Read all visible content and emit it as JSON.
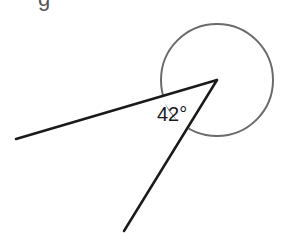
{
  "diagram": {
    "type": "angle-diagram",
    "top_partial_text": "g",
    "vertex": {
      "x": 217,
      "y": 80
    },
    "rays": [
      {
        "name": "left-ray",
        "end": {
          "x": 16,
          "y": 139
        }
      },
      {
        "name": "lower-ray",
        "end": {
          "x": 124,
          "y": 231
        }
      }
    ],
    "full_turn_circle": {
      "cx": 217,
      "cy": 80,
      "r": 56
    },
    "angle_label": "42°",
    "colors": {
      "rays": "#1a1a1a",
      "circle": "#6b6b6b",
      "text": "#1a1a1a",
      "background": "#ffffff"
    }
  }
}
